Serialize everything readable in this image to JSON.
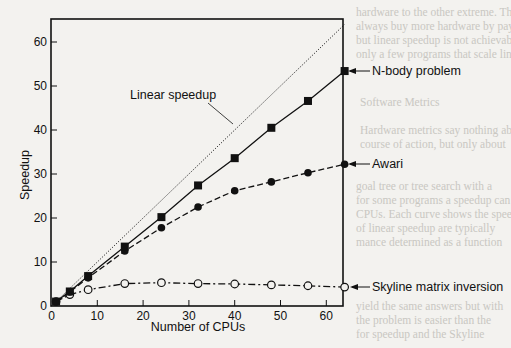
{
  "chart_data": {
    "type": "line",
    "title": "",
    "xlabel": "Number of CPUs",
    "ylabel": "Speedup",
    "xlim": [
      0,
      64
    ],
    "ylim": [
      0,
      65
    ],
    "x_ticks": [
      0,
      10,
      20,
      30,
      40,
      50,
      60
    ],
    "y_ticks": [
      0,
      10,
      20,
      30,
      40,
      50,
      60
    ],
    "grid": false,
    "legend": "inline annotations with arrows",
    "series": [
      {
        "name": "Linear speedup",
        "style": "dotted",
        "marker": "none",
        "x": [
          0,
          64
        ],
        "values": [
          0,
          64
        ]
      },
      {
        "name": "N-body problem",
        "style": "solid",
        "marker": "filled-square",
        "x": [
          1,
          4,
          8,
          16,
          24,
          32,
          40,
          48,
          56,
          64
        ],
        "values": [
          1,
          3.3,
          6.8,
          13.5,
          20.2,
          27.4,
          33.6,
          40.5,
          46.6,
          53.4
        ]
      },
      {
        "name": "Awari",
        "style": "dashed",
        "marker": "filled-circle",
        "x": [
          1,
          4,
          8,
          16,
          24,
          32,
          40,
          48,
          56,
          64
        ],
        "values": [
          1,
          3.2,
          6.4,
          12.5,
          17.8,
          22.5,
          26.2,
          28.2,
          30.3,
          32.2
        ]
      },
      {
        "name": "Skyline matrix inversion",
        "style": "dash-dot",
        "marker": "open-circle",
        "x": [
          1,
          4,
          8,
          16,
          24,
          32,
          40,
          48,
          56,
          64
        ],
        "values": [
          1,
          2.6,
          3.7,
          5.1,
          5.3,
          5.1,
          5.0,
          4.8,
          4.6,
          4.3
        ]
      }
    ],
    "annotations": [
      {
        "text": "Linear speedup",
        "points_to": "dotted diagonal line"
      },
      {
        "text": "N-body problem",
        "points_to": "N-body series end"
      },
      {
        "text": "Awari",
        "points_to": "Awari series end"
      },
      {
        "text": "Skyline matrix inversion",
        "points_to": "Skyline series end"
      }
    ]
  },
  "labels": {
    "xlabel": "Number of CPUs",
    "ylabel": "Speedup",
    "linear": "Linear speedup",
    "nbody": "N-body problem",
    "awari": "Awari",
    "skyline": "Skyline matrix inversion"
  },
  "ticks": {
    "x": [
      "0",
      "10",
      "20",
      "30",
      "40",
      "50",
      "60"
    ],
    "y": [
      "0",
      "10",
      "20",
      "30",
      "40",
      "50",
      "60"
    ]
  }
}
